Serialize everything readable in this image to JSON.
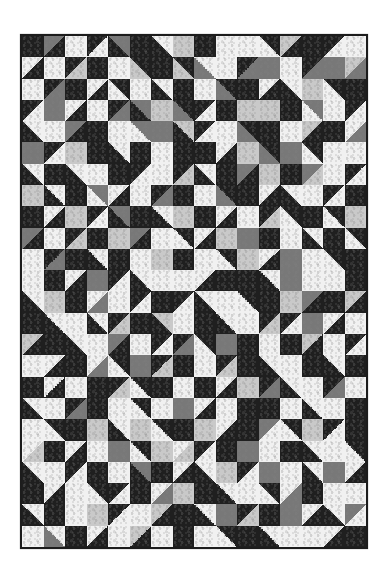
{
  "image": {
    "subject": "Black, white and gray half-square-triangle quilt",
    "grid": {
      "columns": 16,
      "rows": 24
    }
  },
  "palette": {
    "D": "#1f1f1f",
    "M": "#3c3c3c",
    "G": "#787878",
    "S": "#c9c9c9",
    "L": "#f1f1f1"
  },
  "quilt_rows": [
    [
      "D",
      "G-D/",
      "L",
      "D-L/",
      "G-D\\",
      "D",
      "L-D\\",
      "S",
      "D",
      "L",
      "L",
      "D-L\\",
      "S-D/",
      "D",
      "D-L/",
      "L"
    ],
    [
      "L-D/",
      "L",
      "D-S/",
      "D",
      "L",
      "D-S\\",
      "D",
      "D-S\\",
      "L-G\\",
      "L",
      "D-G/",
      "G",
      "L",
      "D-G/",
      "G",
      "S-G/"
    ],
    [
      "L",
      "D-G/",
      "D",
      "L-D/",
      "D-L\\",
      "L",
      "L-D\\",
      "D",
      "L",
      "D-G\\",
      "D",
      "L-D/",
      "L-D\\",
      "S",
      "D-L\\",
      "D"
    ],
    [
      "D-L/",
      "G",
      "L-D/",
      "L",
      "D-G/",
      "G-D\\",
      "S",
      "D-G\\",
      "D-L/",
      "D",
      "S",
      "S",
      "D",
      "G-L\\",
      "L",
      "D-L/"
    ],
    [
      "L-D\\",
      "L",
      "G-D/",
      "D",
      "L",
      "G-L\\",
      "G",
      "S-D\\",
      "D-L/",
      "L",
      "D-G\\",
      "D",
      "L",
      "S-D/",
      "D",
      "L-G/"
    ],
    [
      "G",
      "D-L/",
      "S",
      "D",
      "L-D\\",
      "D",
      "L",
      "D",
      "D",
      "L-D/",
      "S",
      "D-G\\",
      "G",
      "D-L\\",
      "L",
      "L"
    ],
    [
      "L-D\\",
      "D",
      "L-D\\",
      "L",
      "D",
      "D-L/",
      "L",
      "D-S/",
      "L-D\\",
      "D",
      "G-D/",
      "S",
      "D",
      "G-S/",
      "L",
      "D-L/"
    ],
    [
      "S",
      "L-D\\",
      "D",
      "G-L\\",
      "L-D/",
      "L",
      "D-G/",
      "D",
      "L",
      "D-G\\",
      "D",
      "L-D/",
      "L-D\\",
      "L",
      "D-L/",
      "D"
    ],
    [
      "D",
      "L-D/",
      "S",
      "D-L/",
      "G-D\\",
      "D",
      "L-D\\",
      "S",
      "D",
      "L-D/",
      "L",
      "D-S/",
      "D-L\\",
      "D",
      "D-L\\",
      "S"
    ],
    [
      "G-D/",
      "L",
      "D-S/",
      "D",
      "S",
      "G-D/",
      "L",
      "D-L\\",
      "L-D/",
      "S",
      "G",
      "D",
      "L",
      "L-D\\",
      "D",
      "D-L\\"
    ],
    [
      "L",
      "D-G/",
      "D",
      "L-D\\",
      "D",
      "L",
      "S",
      "D",
      "L",
      "D-L\\",
      "S",
      "L-D/",
      "G",
      "L",
      "D-L\\",
      "D"
    ],
    [
      "L",
      "D",
      "L-D/",
      "G",
      "D-L/",
      "L-D\\",
      "L",
      "L",
      "L-D/",
      "D",
      "D",
      "L-D\\",
      "G",
      "L",
      "L",
      "D"
    ],
    [
      "L-D\\",
      "S",
      "D",
      "L-G/",
      "L",
      "D-L/",
      "D",
      "D-L/",
      "L-D\\",
      "L",
      "D-L\\",
      "D",
      "S",
      "G-D/",
      "D",
      "S-D/"
    ],
    [
      "D",
      "L-D\\",
      "L",
      "L-D\\",
      "D-S/",
      "D",
      "S-D\\",
      "L",
      "D",
      "L-D\\",
      "L",
      "D-S/",
      "D-L/",
      "G",
      "L-D/",
      "L"
    ],
    [
      "S-D/",
      "D",
      "L-D\\",
      "L",
      "G-D/",
      "L",
      "D-L/",
      "D-G/",
      "D-L\\",
      "G",
      "D",
      "L",
      "D",
      "S-D/",
      "L",
      "D-L/"
    ],
    [
      "L",
      "L-D/",
      "D",
      "L-G/",
      "D-L\\",
      "G",
      "D-S/",
      "D",
      "L",
      "D-S/",
      "D",
      "L-D\\",
      "L",
      "D",
      "L-D\\",
      "D"
    ],
    [
      "D",
      "L-D/",
      "L",
      "D",
      "D-S/",
      "D-L\\",
      "D",
      "L",
      "D",
      "L-D/",
      "S",
      "D-G/",
      "L-D\\",
      "L",
      "D-G/",
      "L"
    ],
    [
      "L-D\\",
      "L",
      "D-G/",
      "D",
      "L",
      "D-L\\",
      "L",
      "G",
      "L-D/",
      "L",
      "D",
      "D",
      "L",
      "L-D\\",
      "L",
      "D"
    ],
    [
      "L",
      "D-L\\",
      "D",
      "S",
      "L-D\\",
      "S",
      "D-L\\",
      "D",
      "S",
      "L-D/",
      "D",
      "G-L/",
      "D-L\\",
      "S",
      "D-L/",
      "D"
    ],
    [
      "L-S/",
      "D",
      "L-D/",
      "L",
      "G",
      "D-L\\",
      "S",
      "L-S/",
      "D-L/",
      "D",
      "G",
      "L",
      "D",
      "L-D\\",
      "L",
      "D-L\\"
    ],
    [
      "L-D\\",
      "L",
      "D-L/",
      "D",
      "L",
      "G-D\\",
      "D",
      "L-D/",
      "L-D\\",
      "S",
      "D-L/",
      "G",
      "L",
      "L-D\\",
      "G",
      "L-D/"
    ],
    [
      "D",
      "L-D/",
      "L",
      "D-L\\",
      "D-L/",
      "D",
      "L-G/",
      "S",
      "D",
      "L-D\\",
      "L",
      "D-L\\",
      "L-G/",
      "D",
      "L",
      "L"
    ],
    [
      "L-D\\",
      "D",
      "L",
      "S",
      "D-L/",
      "L",
      "S-D/",
      "D",
      "L-D\\",
      "G",
      "D-S/",
      "D",
      "G",
      "L-D/",
      "L-D\\",
      "G-L/"
    ],
    [
      "L",
      "L-G\\",
      "D",
      "L-D/",
      "L",
      "S-D/",
      "L",
      "D",
      "L",
      "D-L\\",
      "D",
      "L-D\\",
      "L",
      "L",
      "L-D/",
      "D"
    ]
  ]
}
